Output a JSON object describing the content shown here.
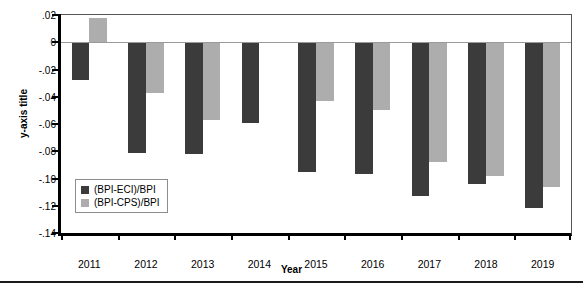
{
  "chart_data": {
    "type": "bar",
    "title": "",
    "xlabel": "Year",
    "ylabel": "y-axis title",
    "categories": [
      "2011",
      "2012",
      "2013",
      "2014",
      "2015",
      "2016",
      "2017",
      "2018",
      "2019"
    ],
    "series": [
      {
        "name": "(BPI-ECI)/BPI",
        "color": "#3b3b3b",
        "values": [
          -0.028,
          -0.081,
          -0.082,
          -0.059,
          -0.095,
          -0.097,
          -0.113,
          -0.104,
          -0.122
        ]
      },
      {
        "name": "(BPI-CPS)/BPI",
        "color": "#adadad",
        "values": [
          0.018,
          -0.037,
          -0.057,
          0.0,
          -0.043,
          -0.05,
          -0.088,
          -0.098,
          -0.106
        ]
      }
    ],
    "ylim": [
      -0.14,
      0.02
    ],
    "yticks": [
      0.02,
      0,
      -0.02,
      -0.04,
      -0.06,
      -0.08,
      -0.1,
      -0.12,
      -0.14
    ],
    "ytick_labels": [
      ".02",
      "0",
      "-.02",
      "-.04",
      "-.06",
      "-.08",
      "-.10",
      "-.12",
      "-.14"
    ],
    "grid": false,
    "legend_position": "inside-lower-left",
    "zero_line": true
  },
  "legend": {
    "items": [
      {
        "label": "(BPI-ECI)/BPI",
        "swatch": "eci"
      },
      {
        "label": "(BPI-CPS)/BPI",
        "swatch": "cps"
      }
    ]
  }
}
